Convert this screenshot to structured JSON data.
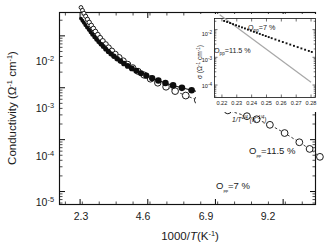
{
  "chart_data": {
    "type": "scatter",
    "title": "",
    "xlabel": "1000/T(K⁻¹)",
    "ylabel": "Conductivity (Ω⁻¹ cm⁻¹)",
    "xlim": [
      1.6,
      10.3
    ],
    "ylim_log": [
      -5.25,
      -1.55
    ],
    "yscale": "log",
    "xticks": [
      "2.3",
      "4.6",
      "6.9",
      "9.2"
    ],
    "xtick_values": [
      2.3,
      4.6,
      6.9,
      9.2
    ],
    "yticks": [
      "10-2",
      "10-3",
      "10-4",
      "10-5"
    ],
    "ytick_values": [
      0.01,
      0.001,
      0.0001,
      1e-05
    ],
    "grid": false,
    "legend_position": "inline-annotations",
    "series": [
      {
        "name": "Opp=11.5 %",
        "marker": "filled-circle",
        "line": "solid",
        "color": "#0d0d0d",
        "points": [
          [
            2.33,
            0.0215
          ],
          [
            2.38,
            0.0196
          ],
          [
            2.43,
            0.0178
          ],
          [
            2.48,
            0.0161
          ],
          [
            2.54,
            0.0145
          ],
          [
            2.6,
            0.0131
          ],
          [
            2.66,
            0.0118
          ],
          [
            2.72,
            0.0106
          ],
          [
            2.79,
            0.00952
          ],
          [
            2.86,
            0.00855
          ],
          [
            2.93,
            0.00768
          ],
          [
            3.01,
            0.0069
          ],
          [
            3.09,
            0.0062
          ],
          [
            3.17,
            0.00557
          ],
          [
            3.26,
            0.00501
          ],
          [
            3.35,
            0.0045
          ],
          [
            3.45,
            0.00404
          ],
          [
            3.56,
            0.00363
          ],
          [
            3.67,
            0.00326
          ],
          [
            3.79,
            0.00293
          ],
          [
            3.92,
            0.00263
          ],
          [
            4.06,
            0.00236
          ],
          [
            4.21,
            0.00212
          ],
          [
            4.37,
            0.0019
          ],
          [
            4.55,
            0.00171
          ],
          [
            4.75,
            0.00153
          ],
          [
            4.96,
            0.00138
          ],
          [
            5.2,
            0.00124
          ],
          [
            5.46,
            0.00111
          ],
          [
            5.76,
            0.000995
          ],
          [
            6.09,
            0.000893
          ],
          [
            6.47,
            0.000801
          ],
          [
            6.9,
            0.000719
          ],
          [
            7.4,
            0.000645
          ],
          [
            7.98,
            0.000579
          ],
          [
            8.67,
            0.000519
          ],
          [
            9.2,
            0.00047
          ],
          [
            9.5,
            0.000448
          ]
        ]
      },
      {
        "name": "Opp=7 %",
        "marker": "open-circle",
        "line": "dashed",
        "color": "#1c1c1c",
        "points": [
          [
            2.33,
            0.0352
          ],
          [
            2.38,
            0.031
          ],
          [
            2.43,
            0.0272
          ],
          [
            2.49,
            0.0238
          ],
          [
            2.55,
            0.0208
          ],
          [
            2.61,
            0.0182
          ],
          [
            2.68,
            0.0159
          ],
          [
            2.75,
            0.0139
          ],
          [
            2.82,
            0.0121
          ],
          [
            2.9,
            0.0105
          ],
          [
            2.98,
            0.00913
          ],
          [
            3.07,
            0.00793
          ],
          [
            3.17,
            0.00688
          ],
          [
            3.27,
            0.00596
          ],
          [
            3.38,
            0.00516
          ],
          [
            3.5,
            0.00446
          ],
          [
            3.63,
            0.00385
          ],
          [
            3.77,
            0.00331
          ],
          [
            3.92,
            0.00284
          ],
          [
            4.09,
            0.00243
          ],
          [
            4.27,
            0.00207
          ],
          [
            4.47,
            0.00176
          ],
          [
            4.69,
            0.00148
          ],
          [
            4.94,
            0.00124
          ],
          [
            5.22,
            0.00104
          ],
          [
            5.53,
            0.00086
          ],
          [
            5.89,
            0.000707
          ],
          [
            6.3,
            0.000576
          ],
          [
            6.77,
            0.000462
          ],
          [
            7.32,
            0.000366
          ],
          [
            7.97,
            0.000283
          ],
          [
            8.3,
            0.000247
          ],
          [
            8.75,
            0.000193
          ],
          [
            9.25,
            0.000134
          ],
          [
            9.75,
            8.9e-05
          ],
          [
            10.1,
            6.62e-05
          ],
          [
            10.45,
            4.66e-05
          ]
        ]
      }
    ],
    "annotations": [
      {
        "text": "Opp=11.5 %",
        "x_px": 249,
        "y_px": 151
      },
      {
        "text": "Opp=7 %",
        "x_px": 218,
        "y_px": 186
      }
    ],
    "inset": {
      "type": "scatter",
      "xlabel": "1/T 1/4 (K-1/4)",
      "ylabel": "σ (Ω⁻¹ cm⁻¹)",
      "xlim": [
        0.215,
        0.283
      ],
      "ylim_log": [
        -4.45,
        -1.6
      ],
      "yscale": "log",
      "xticks": [
        "0.22",
        "0.23",
        "0.24",
        "0.25",
        "0.26",
        "0.27",
        "0.28"
      ],
      "xtick_values": [
        0.22,
        0.23,
        0.24,
        0.25,
        0.26,
        0.27,
        0.28
      ],
      "yticks": [
        "10-2",
        "10-3",
        "10-4"
      ],
      "ytick_values": [
        0.01,
        0.001,
        0.0001
      ],
      "series": [
        {
          "name": "Opp=11.5 %",
          "marker": "small-square",
          "color": "#111111",
          "points": [
            [
              0.2215,
              0.0205
            ],
            [
              0.2235,
              0.0188
            ],
            [
              0.2255,
              0.0172
            ],
            [
              0.2275,
              0.0157
            ],
            [
              0.2295,
              0.0144
            ],
            [
              0.2315,
              0.0131
            ],
            [
              0.2335,
              0.012
            ],
            [
              0.2355,
              0.011
            ],
            [
              0.2375,
              0.01
            ],
            [
              0.2395,
              0.00915
            ],
            [
              0.2415,
              0.00838
            ],
            [
              0.2435,
              0.00766
            ],
            [
              0.2455,
              0.007
            ],
            [
              0.2475,
              0.0064
            ],
            [
              0.2495,
              0.00585
            ],
            [
              0.2515,
              0.00536
            ],
            [
              0.2535,
              0.0049
            ],
            [
              0.256,
              0.0044
            ],
            [
              0.2585,
              0.00396
            ],
            [
              0.261,
              0.00356
            ],
            [
              0.2635,
              0.0032
            ],
            [
              0.266,
              0.00288
            ],
            [
              0.2685,
              0.00259
            ],
            [
              0.271,
              0.00233
            ],
            [
              0.2735,
              0.00209
            ],
            [
              0.276,
              0.00188
            ],
            [
              0.2785,
              0.0017
            ],
            [
              0.2805,
              0.00156
            ]
          ]
        },
        {
          "name": "Opp=7 %",
          "marker": "none",
          "line": "solid-gray",
          "color": "#a8a8a8",
          "points": [
            [
              0.2185,
              0.034
            ],
            [
              0.28,
              0.000125
            ]
          ]
        }
      ],
      "annotations": [
        {
          "text": "Opp=7 %",
          "x_px": 250,
          "y_px": 27
        },
        {
          "text": "Opp=11.5 %",
          "x_px": 216,
          "y_px": 50
        }
      ]
    }
  },
  "axis": {
    "y_title_main": "Conductivity (",
    "y_title_omega": "Ω",
    "y_title_sup1": "-1",
    "y_title_cm": " cm",
    "y_title_sup2": "-1",
    "y_title_close": ")",
    "x_title_1000": "1000/",
    "x_title_T": "T",
    "x_title_k": "(K",
    "x_title_sup": "-1",
    "x_title_close": ")"
  },
  "inset_axis": {
    "y_title_sigma": "σ (",
    "y_title_omega": "Ω",
    "y_title_sup1": "-1",
    "y_title_cm": " cm",
    "y_title_sup2": "-1",
    "y_title_close": ")",
    "x_title_1t": "1/",
    "x_title_T": "T",
    "x_title_sup1": "1/4",
    "x_title_k": "(K",
    "x_title_sup2": "-1/4",
    "x_title_close": ")"
  },
  "labels": {
    "opp_115": "=11.5 %",
    "opp_7": "=7 %",
    "opp_symbol": "O",
    "opp_sub": "pp",
    "ten": "10",
    "exp_m2": "-2",
    "exp_m3": "-3",
    "exp_m4": "-4",
    "exp_m5": "-5"
  }
}
